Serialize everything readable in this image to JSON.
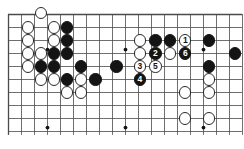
{
  "diagram": {
    "kind": "go-board-diagram",
    "board": {
      "columns": 18,
      "rows": 10,
      "cell_size": 13,
      "origin_x": 8,
      "origin_y": 14,
      "line_color": "#4a4a4a",
      "border_color": "#2b2b2b",
      "background_color": "#ffffff",
      "stone_radius": 6.2
    },
    "star_points": [
      {
        "col": 3,
        "row": 2.7
      },
      {
        "col": 9,
        "row": 2.7
      },
      {
        "col": 15,
        "row": 2.7
      },
      {
        "col": 3,
        "row": 8.7
      },
      {
        "col": 9,
        "row": 8.7
      },
      {
        "col": 15,
        "row": 8.7
      }
    ],
    "colors": {
      "black_stone": "#141414",
      "white_stone": "#ffffff",
      "white_stone_edge": "#2a2a2a",
      "black_label_text": "#ffffff",
      "white_label_text": "#141414",
      "grid_line": "#4a4a4a"
    },
    "move_sequence": [
      {
        "number": "1",
        "color": "white"
      },
      {
        "number": "2",
        "color": "black"
      },
      {
        "number": "3",
        "color": "white"
      },
      {
        "number": "4",
        "color": "black"
      },
      {
        "number": "5",
        "color": "white"
      },
      {
        "number": "6",
        "color": "black"
      }
    ],
    "stones": [
      {
        "col": 2.5,
        "row": -0.1,
        "color": "white",
        "label": ""
      },
      {
        "col": 1.5,
        "row": 1.0,
        "color": "white",
        "label": ""
      },
      {
        "col": 3.5,
        "row": 1.0,
        "color": "white",
        "label": ""
      },
      {
        "col": 4.5,
        "row": 1.0,
        "color": "black",
        "label": ""
      },
      {
        "col": 1.5,
        "row": 2.0,
        "color": "white",
        "label": ""
      },
      {
        "col": 3.5,
        "row": 2.0,
        "color": "white",
        "label": ""
      },
      {
        "col": 4.5,
        "row": 2.0,
        "color": "black",
        "label": ""
      },
      {
        "col": 10.1,
        "row": 2.0,
        "color": "white",
        "label": ""
      },
      {
        "col": 11.3,
        "row": 2.0,
        "color": "black",
        "label": ""
      },
      {
        "col": 12.4,
        "row": 2.0,
        "color": "black",
        "label": ""
      },
      {
        "col": 13.6,
        "row": 2.0,
        "color": "white",
        "label": "1"
      },
      {
        "col": 15.4,
        "row": 2.0,
        "color": "black",
        "label": ""
      },
      {
        "col": 1.5,
        "row": 3.0,
        "color": "white",
        "label": ""
      },
      {
        "col": 2.5,
        "row": 3.0,
        "color": "white",
        "label": ""
      },
      {
        "col": 3.5,
        "row": 3.0,
        "color": "black",
        "label": ""
      },
      {
        "col": 4.5,
        "row": 3.0,
        "color": "black",
        "label": ""
      },
      {
        "col": 10.1,
        "row": 3.0,
        "color": "white",
        "label": ""
      },
      {
        "col": 11.3,
        "row": 3.0,
        "color": "black",
        "label": "2"
      },
      {
        "col": 12.4,
        "row": 3.0,
        "color": "white",
        "label": ""
      },
      {
        "col": 13.6,
        "row": 3.0,
        "color": "black",
        "label": "6"
      },
      {
        "col": 17.4,
        "row": 3.0,
        "color": "black",
        "label": ""
      },
      {
        "col": 1.5,
        "row": 4.0,
        "color": "white",
        "label": ""
      },
      {
        "col": 2.5,
        "row": 4.0,
        "color": "black",
        "label": ""
      },
      {
        "col": 3.5,
        "row": 4.0,
        "color": "black",
        "label": ""
      },
      {
        "col": 5.6,
        "row": 4.0,
        "color": "black",
        "label": ""
      },
      {
        "col": 8.3,
        "row": 4.0,
        "color": "black",
        "label": ""
      },
      {
        "col": 10.1,
        "row": 4.0,
        "color": "white",
        "label": "3"
      },
      {
        "col": 11.3,
        "row": 4.0,
        "color": "white",
        "label": "5"
      },
      {
        "col": 15.4,
        "row": 4.0,
        "color": "black",
        "label": ""
      },
      {
        "col": 2.5,
        "row": 5.0,
        "color": "white",
        "label": ""
      },
      {
        "col": 3.5,
        "row": 5.0,
        "color": "white",
        "label": ""
      },
      {
        "col": 4.5,
        "row": 5.0,
        "color": "black",
        "label": ""
      },
      {
        "col": 5.6,
        "row": 5.0,
        "color": "white",
        "label": ""
      },
      {
        "col": 6.7,
        "row": 5.0,
        "color": "black",
        "label": ""
      },
      {
        "col": 10.1,
        "row": 5.0,
        "color": "black",
        "label": "4"
      },
      {
        "col": 15.4,
        "row": 5.0,
        "color": "white",
        "label": ""
      },
      {
        "col": 4.5,
        "row": 6.0,
        "color": "white",
        "label": ""
      },
      {
        "col": 5.6,
        "row": 6.0,
        "color": "white",
        "label": ""
      },
      {
        "col": 13.6,
        "row": 6.0,
        "color": "white",
        "label": ""
      },
      {
        "col": 15.4,
        "row": 6.0,
        "color": "white",
        "label": ""
      },
      {
        "col": 13.6,
        "row": 8.0,
        "color": "white",
        "label": ""
      },
      {
        "col": 15.4,
        "row": 8.0,
        "color": "white",
        "label": ""
      }
    ]
  }
}
